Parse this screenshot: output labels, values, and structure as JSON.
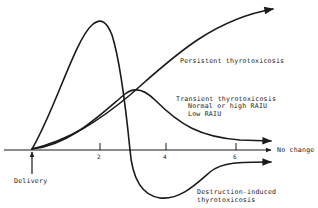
{
  "diagram": {
    "title": "",
    "colors": {
      "ink": "#1a1a1a",
      "background": "#ffffff"
    },
    "axis": {
      "ticks": [
        "2",
        "4",
        "6"
      ],
      "origin_label": "Delivery",
      "end_label": "No change"
    },
    "curves": [
      {
        "id": "persistent",
        "label": "Persistent thyrotoxicosis"
      },
      {
        "id": "transient",
        "label": "Transient thyrotoxicosis",
        "sublabels": [
          "Normal or high RAIU",
          "Low RAIU"
        ]
      },
      {
        "id": "destruction",
        "label_lines": [
          "Destruction-induced",
          "thyrotoxicosis"
        ]
      }
    ]
  }
}
